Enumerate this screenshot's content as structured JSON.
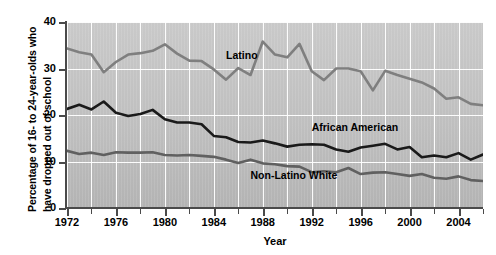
{
  "chart_data": {
    "type": "line",
    "title": "",
    "xlabel": "Year",
    "ylabel": "Percentage of 16- to 24-year-olds who have dropped out of school",
    "ylabel_line1": "Percentage of 16- to 24-year-olds who",
    "ylabel_line2": "have dropped out of school",
    "xlim": [
      1972,
      2006
    ],
    "ylim": [
      0,
      40
    ],
    "yticks": [
      0,
      10,
      20,
      30,
      40
    ],
    "ytick_labels": [
      "0",
      "10",
      "20",
      "30",
      "40"
    ],
    "xticks": [
      1972,
      1974,
      1976,
      1978,
      1980,
      1982,
      1984,
      1986,
      1988,
      1990,
      1992,
      1994,
      1996,
      1998,
      2000,
      2002,
      2004,
      2006
    ],
    "xtick_labels_major": [
      "1972",
      "1976",
      "1980",
      "1984",
      "1988",
      "1992",
      "1996",
      "2000",
      "2004"
    ],
    "xticks_major": [
      1972,
      1976,
      1980,
      1984,
      1988,
      1992,
      1996,
      2000,
      2004
    ],
    "grid": "white gridlines, vertical every 2 years, horizontal at each y tick",
    "legend": "inline labels on plot",
    "plot_background": "#c0c0c0",
    "x": [
      1972,
      1973,
      1974,
      1975,
      1976,
      1977,
      1978,
      1979,
      1980,
      1981,
      1982,
      1983,
      1984,
      1985,
      1986,
      1987,
      1988,
      1989,
      1990,
      1991,
      1992,
      1993,
      1994,
      1995,
      1996,
      1997,
      1998,
      1999,
      2000,
      2001,
      2002,
      2003,
      2004,
      2005,
      2006
    ],
    "series": [
      {
        "name": "Latino",
        "color": "#7f7f7f",
        "values": [
          34.3,
          33.5,
          33.0,
          29.2,
          31.4,
          33.0,
          33.3,
          33.8,
          35.2,
          33.2,
          31.7,
          31.6,
          29.8,
          27.6,
          30.1,
          28.6,
          35.8,
          33.0,
          32.4,
          35.3,
          29.4,
          27.5,
          30.0,
          30.0,
          29.4,
          25.3,
          29.5,
          28.6,
          27.8,
          27.0,
          25.7,
          23.5,
          23.8,
          22.4,
          22.1
        ]
      },
      {
        "name": "African American",
        "color": "#1a1a1a",
        "values": [
          21.3,
          22.2,
          21.2,
          22.9,
          20.5,
          19.8,
          20.2,
          21.1,
          19.1,
          18.4,
          18.4,
          18.0,
          15.5,
          15.2,
          14.2,
          14.1,
          14.5,
          13.9,
          13.2,
          13.6,
          13.7,
          13.6,
          12.6,
          12.1,
          13.0,
          13.4,
          13.8,
          12.6,
          13.1,
          10.9,
          11.3,
          10.9,
          11.8,
          10.4,
          11.5
        ]
      },
      {
        "name": "Non-Latino White",
        "color": "#606060",
        "values": [
          12.3,
          11.6,
          11.9,
          11.4,
          12.0,
          11.9,
          11.9,
          12.0,
          11.4,
          11.3,
          11.4,
          11.2,
          11.0,
          10.4,
          9.7,
          10.4,
          9.6,
          9.4,
          9.0,
          8.9,
          7.7,
          7.9,
          7.7,
          8.6,
          7.3,
          7.6,
          7.7,
          7.3,
          6.9,
          7.3,
          6.5,
          6.3,
          6.8,
          6.0,
          5.8
        ]
      }
    ],
    "annotations": [
      {
        "text": "Latino",
        "x": 1985,
        "y": 33.0
      },
      {
        "text": "African American",
        "x": 1992,
        "y": 17.5
      },
      {
        "text": "Non-Latino White",
        "x": 1987,
        "y": 7.0
      }
    ]
  }
}
